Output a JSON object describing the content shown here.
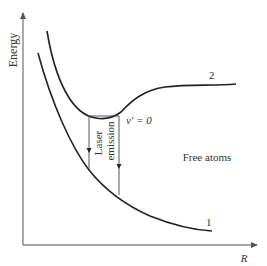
{
  "diagram": {
    "type": "potential-energy-curves",
    "axes": {
      "y_label": "Energy",
      "x_label": "R"
    },
    "curves": [
      {
        "id": "1",
        "label": "1",
        "description": "repulsive ground state"
      },
      {
        "id": "2",
        "label": "2",
        "description": "bound excited state with well"
      }
    ],
    "annotations": {
      "vibrational_level": "v′ = 0",
      "transition_label_line1": "Laser",
      "transition_label_line2": "emission",
      "region_label": "Free atoms"
    },
    "colors": {
      "curve": "#222222",
      "axis": "#555555",
      "text": "#333333",
      "background": "#ffffff"
    }
  }
}
